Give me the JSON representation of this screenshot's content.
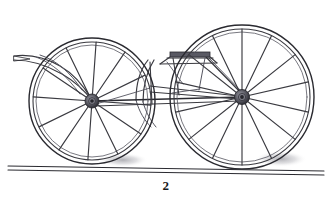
{
  "figure": {
    "caption": "2",
    "style": "line engraving",
    "background_color": "#ffffff",
    "ink_color": "#3a3a40",
    "dark_ink_color": "#2a2a30",
    "shadow_color": "#8c8c94",
    "canvas": {
      "width": 332,
      "height": 203
    }
  },
  "scene": {
    "ground": {
      "name": "ground-line",
      "upper_line": {
        "x1": 8,
        "y1": 166,
        "x2": 324,
        "y2": 171
      },
      "lower_line": {
        "x1": 8,
        "y1": 170,
        "x2": 324,
        "y2": 175
      },
      "stroke_width": 1.1
    },
    "shadows": [
      {
        "name": "left-wheel-shadow",
        "cx": 123,
        "cy": 160,
        "rx": 25,
        "ry": 7
      },
      {
        "name": "right-wheel-shadow",
        "cx": 281,
        "cy": 159,
        "rx": 26,
        "ry": 8
      }
    ]
  },
  "wheels": [
    {
      "name": "left-wheel",
      "cx": 92,
      "cy": 101,
      "tire_radius": 63,
      "felloe_radius": 59,
      "inner_ring_radius": 56,
      "hub_outer_radius": 7,
      "hub_inner_radius": 3.4,
      "hub_core_radius": 1.8,
      "spoke_count": 12,
      "spoke_start_angle_deg": -86,
      "spoke_width": 1.15
    },
    {
      "name": "right-wheel",
      "cx": 242,
      "cy": 97,
      "tire_radius": 72,
      "felloe_radius": 68,
      "inner_ring_radius": 65,
      "hub_outer_radius": 7.5,
      "hub_inner_radius": 3.6,
      "hub_core_radius": 1.9,
      "spoke_count": 14,
      "spoke_start_angle_deg": -90,
      "spoke_width": 1.15
    }
  ],
  "frame": {
    "axle_bar": {
      "name": "axle-bar",
      "x1": 92,
      "y1": 101,
      "x2": 242,
      "y2": 97
    },
    "lower_rail": {
      "name": "lower-rail",
      "x1": 96,
      "y1": 106,
      "x2": 240,
      "y2": 101
    },
    "reach_upper": {
      "name": "reach-upper",
      "x1": 150,
      "y1": 86,
      "x2": 238,
      "y2": 96
    },
    "reach_lower": {
      "name": "reach-lower",
      "x1": 150,
      "y1": 92,
      "x2": 238,
      "y2": 99
    },
    "brace_front": {
      "name": "front-brace",
      "x1": 150,
      "y1": 62,
      "x2": 152,
      "y2": 104
    },
    "brace_rear": {
      "name": "rear-brace",
      "x1": 206,
      "y1": 57,
      "x2": 244,
      "y2": 96
    }
  },
  "seat": {
    "name": "seat-platform",
    "board": {
      "x": 170,
      "y": 52,
      "width": 40,
      "height": 5
    },
    "board_edge": {
      "x1": 168,
      "y1": 58,
      "x2": 212,
      "y2": 58
    },
    "apron_left": {
      "x1": 170,
      "y1": 57,
      "x2": 160,
      "y2": 64
    },
    "apron_right": {
      "x1": 210,
      "y1": 57,
      "x2": 216,
      "y2": 63
    },
    "support_left": {
      "x1": 172,
      "y1": 58,
      "x2": 178,
      "y2": 94
    },
    "support_right": {
      "x1": 206,
      "y1": 58,
      "x2": 200,
      "y2": 90
    },
    "rail_under": {
      "x1": 160,
      "y1": 64,
      "x2": 216,
      "y2": 63
    }
  },
  "shaft": {
    "name": "draft-shaft",
    "tip": {
      "x": 14,
      "y": 56
    },
    "upper_curve": "M14,56 C30,54 46,58 60,66 C74,74 84,86 92,100",
    "lower_curve": "M14,60 C30,60 48,66 62,74 C76,82 86,92 93,102",
    "tip_wedge": "M14,56 L30,59 L14,61 Z",
    "stay_curve": "M40,55 C56,60 70,72 82,90"
  },
  "bodywork": {
    "name": "body-panel",
    "curve_outer": "M148,60 C140,70 136,84 136,100",
    "curve_inner": "M154,60 C147,71 143,85 143,102",
    "front_arc": "M136,100 C140,112 146,120 152,126"
  },
  "annotations": {
    "figure_label": "2"
  }
}
